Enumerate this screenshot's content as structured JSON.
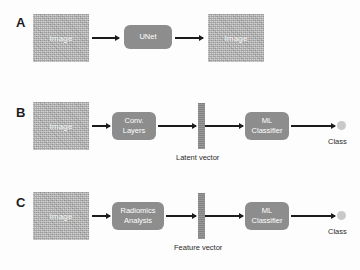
{
  "figure": {
    "background_color": "#fdfdfd",
    "box_color": "#8d8d8d",
    "image_block_color": "#b9b9b9",
    "arrow_color": "#1b1b1b",
    "class_dot_color": "#c9c9c9"
  },
  "panels": [
    {
      "letter": "A",
      "nodes": {
        "input_image": "Image",
        "process": {
          "line1": "UNet"
        },
        "output_image": "Image"
      }
    },
    {
      "letter": "B",
      "nodes": {
        "input_image": "Image",
        "process": {
          "line1": "Conv.",
          "line2": "Layers"
        },
        "vector_caption": "Latent vector",
        "classifier": {
          "line1": "ML",
          "line2": "Classifier"
        },
        "output_label": "Class"
      }
    },
    {
      "letter": "C",
      "nodes": {
        "input_image": "Image",
        "process": {
          "line1": "Radiomics",
          "line2": "Analysis"
        },
        "vector_caption": "Feature vector",
        "classifier": {
          "line1": "ML",
          "line2": "Classifier"
        },
        "output_label": "Class"
      }
    }
  ]
}
